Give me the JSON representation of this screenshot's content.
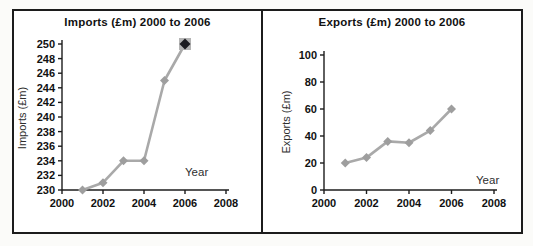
{
  "frame": {
    "border_color": "#1c1c1c",
    "background": "#ffffff"
  },
  "chart_data": [
    {
      "type": "line",
      "title": "Imports (£m) 2000 to 2006",
      "xlabel": "Year",
      "ylabel": "Imports (£m)",
      "x": [
        2001,
        2002,
        2003,
        2004,
        2005,
        2006
      ],
      "values": [
        230,
        231,
        234,
        234,
        245,
        250
      ],
      "xlim": [
        2000,
        2008
      ],
      "ylim": [
        230,
        250
      ],
      "xticks": [
        2000,
        2002,
        2004,
        2006,
        2008
      ],
      "yticks": [
        230,
        232,
        234,
        236,
        238,
        240,
        242,
        244,
        246,
        248,
        250
      ],
      "grid": false,
      "legend": null,
      "line_color": "#a9a9a9",
      "marker": "diamond",
      "marker_color": "#9e9e9e",
      "highlight_last_point": true,
      "highlight_marker_color": "#1d1d22",
      "highlight_box_color": "#b4b4b4"
    },
    {
      "type": "line",
      "title": "Exports (£m) 2000 to 2006",
      "xlabel": "Year",
      "ylabel": "Exports (£m)",
      "x": [
        2001,
        2002,
        2003,
        2004,
        2005,
        2006
      ],
      "values": [
        20,
        24,
        36,
        35,
        44,
        60
      ],
      "xlim": [
        2000,
        2008
      ],
      "ylim": [
        0,
        100
      ],
      "xticks": [
        2000,
        2002,
        2004,
        2006,
        2008
      ],
      "yticks": [
        0,
        20,
        40,
        60,
        80,
        100
      ],
      "grid": false,
      "legend": null,
      "line_color": "#a9a9a9",
      "marker": "diamond",
      "marker_color": "#9e9e9e",
      "highlight_last_point": false,
      "highlight_marker_color": null,
      "highlight_box_color": null
    }
  ]
}
